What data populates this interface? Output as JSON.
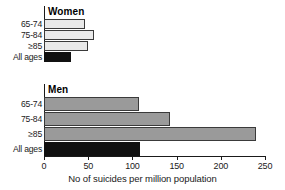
{
  "chart_data": {
    "type": "bar",
    "orientation": "horizontal",
    "title": "",
    "xlabel": "No of suicides per million population",
    "ylabel": "",
    "xlim": [
      0,
      250
    ],
    "xticks": [
      0,
      50,
      100,
      150,
      200,
      250
    ],
    "grid": false,
    "legend": "none",
    "panels": [
      {
        "name": "Women",
        "categories": [
          "65-74",
          "75-84",
          "≥85",
          "All ages"
        ],
        "values": [
          46,
          56,
          50,
          31
        ],
        "colors": [
          "#e9e9e9",
          "#e9e9e9",
          "#e9e9e9",
          "#111111"
        ]
      },
      {
        "name": "Men",
        "categories": [
          "65-74",
          "75-84",
          "≥85",
          "All ages"
        ],
        "values": [
          107,
          143,
          240,
          109
        ],
        "colors": [
          "#9a9a9a",
          "#9a9a9a",
          "#9a9a9a",
          "#111111"
        ]
      }
    ]
  },
  "axis": {
    "tick_labels": [
      "0",
      "50",
      "100",
      "150",
      "200",
      "250"
    ],
    "title": "No of suicides per million population"
  },
  "panel_titles": {
    "women": "Women",
    "men": "Men"
  },
  "colors": {
    "women_bar": "#e9e9e9",
    "men_bar": "#9a9a9a",
    "all_ages_bar": "#111111",
    "axis": "#1a1a1a",
    "background": "#ffffff"
  }
}
